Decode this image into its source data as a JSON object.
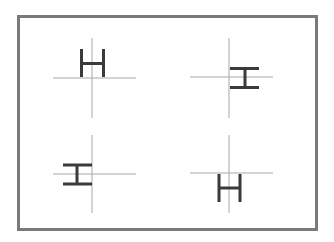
{
  "figure": {
    "frame_color": "#7a7a7a",
    "axis_color": "#a8a8a8",
    "glyph_color": "#3a3a3a",
    "glyph": "H",
    "panels": [
      {
        "id": "top-left",
        "rotation_deg": 0,
        "anchor": "bottom-center",
        "origin": [
          92,
          78
        ]
      },
      {
        "id": "top-right",
        "rotation_deg": 90,
        "anchor": "left-center",
        "origin": [
          229,
          77
        ]
      },
      {
        "id": "bottom-left",
        "rotation_deg": 90,
        "anchor": "right-center",
        "origin": [
          92,
          174
        ]
      },
      {
        "id": "bottom-right",
        "rotation_deg": 0,
        "anchor": "top-center",
        "origin": [
          229,
          173
        ]
      }
    ]
  }
}
